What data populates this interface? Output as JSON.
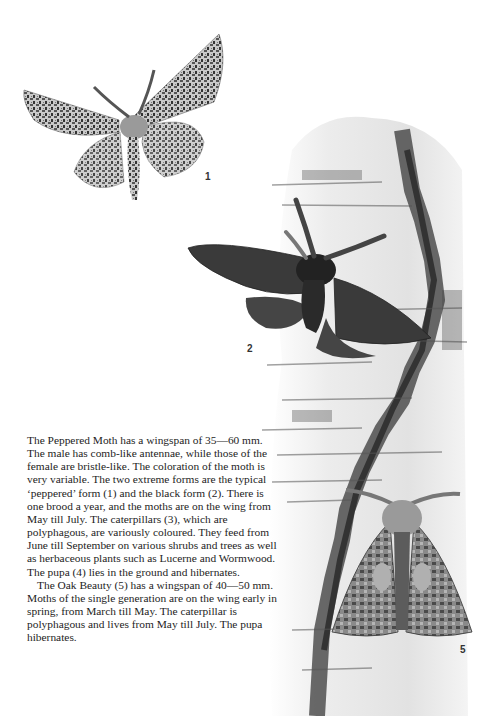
{
  "figures": [
    {
      "id": 1,
      "label": "1",
      "subject": "Peppered Moth, typical 'peppered' form",
      "icon": "moth-peppered-icon"
    },
    {
      "id": 2,
      "label": "2",
      "subject": "Peppered Moth, black form",
      "icon": "moth-black-icon"
    },
    {
      "id": 5,
      "label": "5",
      "subject": "Oak Beauty",
      "icon": "moth-oak-beauty-icon"
    }
  ],
  "background": {
    "subject": "birch bark trunk",
    "icon": "birch-bark-icon"
  },
  "text": {
    "paragraph_1": "The Peppered Moth has a wingspan of 35—60 mm. The male has comb-like antennae, while those of the female are bristle-like. The coloration of the moth is very variable. The two extreme forms are the typical ‘peppered’ form (1) and the black form (2). There is one brood a year, and the moths are on the wing from May till July. The caterpillars (3), which are polyphagous, are variously coloured. They feed from June till September on various shrubs and trees as well as herbaceous plants such as Lucerne and Wormwood. The pupa (4) lies in the ground and hibernates.",
    "paragraph_2": "The Oak Beauty (5) has a wingspan of 40—50 mm. Moths of the single generation are on the wing early in spring, from March till May. The caterpillar is polyphagous and lives from May till July. The pupa hibernates."
  },
  "colors": {
    "paper": "#ffffff",
    "text": "#1d1d1d",
    "bark_light": "#e9e9e9",
    "bark_dark": "#3a3a3a",
    "black_moth": "#2e2e2e",
    "peppered_light": "#bdbdbd"
  }
}
